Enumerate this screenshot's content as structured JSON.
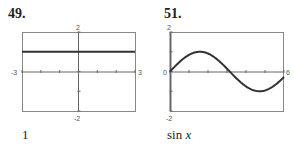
{
  "problems": [
    {
      "number": "49.",
      "answer": "1"
    },
    {
      "number": "51.",
      "answer_prefix": "sin ",
      "answer_var": "x"
    }
  ],
  "chart_data": [
    {
      "type": "line",
      "title": "49.",
      "function": "y = 1",
      "x": [
        -3,
        3
      ],
      "y": [
        1,
        1
      ],
      "xlim": [
        -3,
        3
      ],
      "ylim": [
        -2,
        2
      ],
      "tick_labels": {
        "x_left": "-3",
        "x_right": "3",
        "y_top": "2",
        "y_bottom": "-2"
      },
      "x_ticks_step": 1,
      "y_ticks_step": 1,
      "grid": false,
      "answer": "1"
    },
    {
      "type": "line",
      "title": "51.",
      "function": "y = sin x",
      "x": [
        0,
        0.5,
        1,
        1.5708,
        2,
        2.5,
        3,
        3.1416,
        3.5,
        4,
        4.5,
        4.7124,
        5,
        5.5,
        6
      ],
      "y": [
        0,
        0.479,
        0.841,
        1,
        0.909,
        0.598,
        0.141,
        0,
        -0.351,
        -0.757,
        -0.978,
        -1,
        -0.959,
        -0.706,
        -0.279
      ],
      "xlim": [
        0,
        6
      ],
      "ylim": [
        -2,
        2
      ],
      "tick_labels": {
        "x_left": "0",
        "x_right": "6",
        "y_top": "2",
        "y_bottom": "-2"
      },
      "x_ticks_step": 1,
      "y_ticks_step": 1,
      "grid": false,
      "answer": "sin x"
    }
  ],
  "colors": {
    "frame": "#888888",
    "axis": "#666666",
    "curve": "#333333"
  }
}
